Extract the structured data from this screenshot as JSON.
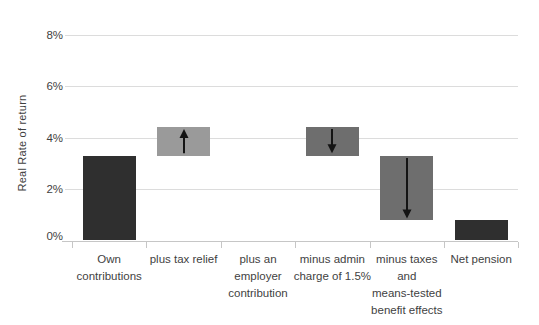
{
  "chart_data": {
    "type": "bar",
    "subtype": "waterfall",
    "ylabel": "Real Rate of return",
    "xlabel": "",
    "ylim": [
      0,
      8
    ],
    "grid": true,
    "legend": false,
    "ytick_values": [
      0,
      2,
      4,
      6,
      8
    ],
    "ytick_labels": [
      "0%",
      "2%",
      "4%",
      "6%",
      "8%"
    ],
    "categories": [
      "Own\ncontributions",
      "plus tax relief",
      "plus an\nemployer\ncontribution",
      "minus admin\ncharge of 1.5%",
      "minus taxes\nand\nmeans-tested\nbenefit effects",
      "Net pension"
    ],
    "bars": [
      {
        "category": "Own contributions",
        "start": 0,
        "end": 3.3,
        "change": 3.3,
        "color": "#2f2f2f",
        "arrow": "none"
      },
      {
        "category": "plus tax relief",
        "start": 3.3,
        "end": 4.4,
        "change": 1.1,
        "color": "#9a9a9a",
        "arrow": "up"
      },
      {
        "category": "plus an employer contribution",
        "start": null,
        "end": null,
        "change": 0,
        "color": null,
        "arrow": "none"
      },
      {
        "category": "minus admin charge of 1.5%",
        "start": 4.4,
        "end": 3.3,
        "change": -1.1,
        "color": "#6e6e6e",
        "arrow": "down"
      },
      {
        "category": "minus taxes and means-tested benefit effects",
        "start": 3.3,
        "end": 0.8,
        "change": -2.5,
        "color": "#6e6e6e",
        "arrow": "down"
      },
      {
        "category": "Net pension",
        "start": 0,
        "end": 0.8,
        "change": 0.8,
        "color": "#2f2f2f",
        "arrow": "none"
      }
    ],
    "colors": {
      "dark_bar": "#2f2f2f",
      "light_bar": "#9a9a9a",
      "mid_bar": "#6e6e6e",
      "arrow": "#141414",
      "gridline": "#dcdcdc",
      "axis": "#c6c6c6",
      "text": "#3f3f3f",
      "background": "#ffffff"
    }
  }
}
